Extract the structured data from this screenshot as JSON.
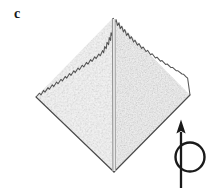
{
  "figure": {
    "panel_label": "c",
    "caption_visible": "",
    "background_color": "#ffffff"
  },
  "specimen": {
    "name": "diamond-shaped-crystal",
    "shape": "rhombus",
    "outline_color": "#4a4a4a",
    "fill_color": "#f6f6f6",
    "texture": "speckled-grain",
    "vertices": {
      "top": [
        113,
        18
      ],
      "left": [
        36,
        97
      ],
      "bottom": [
        114,
        172
      ],
      "right": [
        190,
        95
      ]
    },
    "edges": {
      "upper_left": "jagged",
      "upper_right": "jagged",
      "lower_left": "smooth",
      "lower_right": "smooth"
    },
    "crease": {
      "name": "central-fold-line",
      "color": "#8c8c8c",
      "x_positions": [
        112.5,
        115.0
      ],
      "y_top": 19,
      "y_bottom": 171
    }
  },
  "rotation_symbol": {
    "name": "rotation-axis-indicator",
    "color": "#1a1a1a",
    "arrow": {
      "x": 181,
      "y_tail": 188,
      "y_tip": 120,
      "head_width": 9,
      "head_length": 13,
      "shaft_width": 2.2
    },
    "circle": {
      "cx": 190,
      "cy": 157,
      "r": 14.5,
      "stroke_width": 2.4
    }
  },
  "colors": {
    "ink": "#1a1a1a",
    "outline": "#4a4a4a",
    "crease": "#8c8c8c",
    "paper": "#ffffff",
    "specimen_light": "#fafafa",
    "specimen_mid": "#f0f0f0",
    "specimen_shade": "#e6e6e6"
  }
}
